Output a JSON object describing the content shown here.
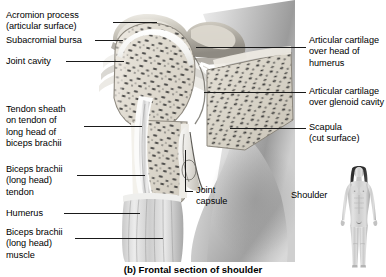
{
  "figure": {
    "caption": "(b) Frontal section of shoulder",
    "alt": "Grayscale frontal section photograph of the human shoulder joint",
    "background_color": "#ffffff",
    "leader_line_color": "#1a1a1a",
    "text_color": "#000000"
  },
  "labels_left": [
    {
      "name": "acromion-process",
      "lines": [
        "Acromion process",
        "(articular surface)"
      ],
      "text": "Acromion process\n(articular surface)"
    },
    {
      "name": "subacromial-bursa",
      "lines": [
        "Subacromial bursa"
      ],
      "text": "Subacromial bursa"
    },
    {
      "name": "joint-cavity",
      "lines": [
        "Joint cavity"
      ],
      "text": "Joint cavity"
    },
    {
      "name": "tendon-sheath",
      "lines": [
        "Tendon sheath",
        "on tendon of",
        "long head of",
        "biceps brachii"
      ],
      "text": "Tendon sheath\non tendon of\nlong head of\nbiceps brachii"
    },
    {
      "name": "biceps-brachii-tendon",
      "lines": [
        "Biceps brachii",
        "(long head)",
        "tendon"
      ],
      "text": "Biceps brachii\n(long head)\ntendon"
    },
    {
      "name": "humerus",
      "lines": [
        "Humerus"
      ],
      "text": "Humerus"
    },
    {
      "name": "biceps-brachii-muscle",
      "lines": [
        "Biceps brachii",
        "(long head)",
        "muscle"
      ],
      "text": "Biceps brachii\n(long head)\nmuscle"
    }
  ],
  "labels_right": [
    {
      "name": "articular-cartilage-humerus",
      "lines": [
        "Articular cartilage",
        "over head of",
        "humerus"
      ],
      "text": "Articular cartilage\nover head of\nhumerus"
    },
    {
      "name": "articular-cartilage-glenoid",
      "lines": [
        "Articular cartilage",
        "over glenoid cavity"
      ],
      "text": "Articular cartilage\nover glenoid cavity"
    },
    {
      "name": "scapula",
      "lines": [
        "Scapula",
        "(cut surface)"
      ],
      "text": "Scapula\n(cut surface)"
    },
    {
      "name": "shoulder-orientation",
      "lines": [
        "Shoulder"
      ],
      "text": "Shoulder"
    }
  ],
  "labels_center": [
    {
      "name": "joint-capsule",
      "lines": [
        "Joint",
        "capsule"
      ],
      "text": "Joint\ncapsule"
    }
  ],
  "body_figure": {
    "name": "whole-body-orientation-figure",
    "description": "anterior view of a female human body, grayscale"
  }
}
